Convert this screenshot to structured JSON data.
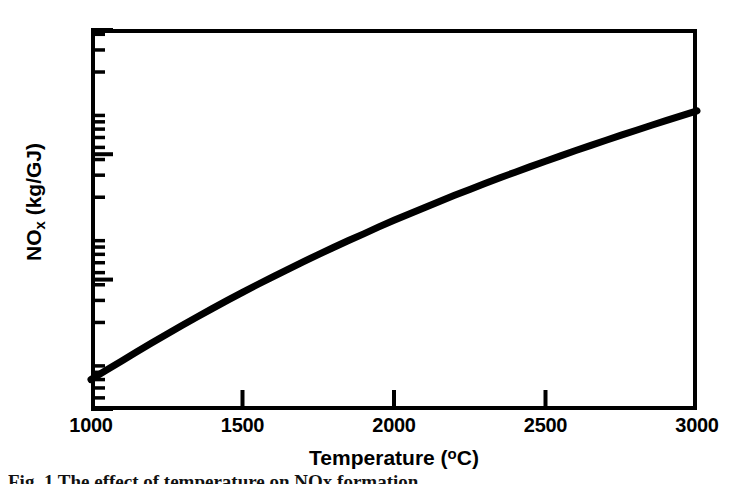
{
  "figure": {
    "caption": "Fig. 1 The effect of temperature on NOx formation",
    "background_color": "#ffffff",
    "ink_color": "#000000"
  },
  "axes": {
    "x_title_main": "Temperature (",
    "x_title_degree": "o",
    "x_title_tail": "C)",
    "x_title_full": "Temperature (°C)",
    "y_title_main": "NO",
    "y_title_sub": "x",
    "y_title_tail": " (kg/GJ)",
    "y_title_full": "NOx (kg/GJ)"
  },
  "chart_data": {
    "type": "line",
    "title": "",
    "subtitle": "",
    "xlabel": "Temperature (°C)",
    "ylabel": "NOx (kg/GJ)",
    "xscale": "linear",
    "yscale": "log",
    "xlim": [
      1000,
      3000
    ],
    "ylim": [
      0.04,
      44.1
    ],
    "grid": false,
    "legend": false,
    "legend_position": "none",
    "xticks": [
      1000,
      1500,
      2000,
      2500,
      3000
    ],
    "xtick_labels": [
      "1000",
      "1500",
      "2000",
      "2500",
      "3000"
    ],
    "yticks": [
      0.04,
      0.44,
      4.41,
      44.1
    ],
    "ytick_labels": [
      "0.04",
      "0.44",
      "4.41",
      "44.1"
    ],
    "y_minor_ticks_per_decade": 9,
    "tick_direction": "in",
    "series": [
      {
        "name": "NOx formation",
        "color": "#000000",
        "line_width": 7,
        "x": [
          1000,
          1050,
          1100,
          1150,
          1200,
          1250,
          1300,
          1350,
          1400,
          1450,
          1500,
          1550,
          1600,
          1650,
          1700,
          1750,
          1800,
          1850,
          1900,
          1950,
          2000,
          2050,
          2100,
          2150,
          2200,
          2250,
          2300,
          2350,
          2400,
          2450,
          2500,
          2550,
          2600,
          2650,
          2700,
          2750,
          2800,
          2850,
          2900,
          2950,
          3000
        ],
        "y": [
          0.07,
          0.083,
          0.098,
          0.116,
          0.137,
          0.161,
          0.189,
          0.221,
          0.258,
          0.3,
          0.348,
          0.402,
          0.463,
          0.532,
          0.61,
          0.697,
          0.794,
          0.902,
          1.02,
          1.16,
          1.31,
          1.47,
          1.65,
          1.85,
          2.07,
          2.31,
          2.57,
          2.86,
          3.17,
          3.51,
          3.88,
          4.28,
          4.72,
          5.19,
          5.7,
          6.26,
          6.86,
          7.51,
          8.21,
          8.97,
          9.8
        ]
      }
    ],
    "annotations": []
  }
}
